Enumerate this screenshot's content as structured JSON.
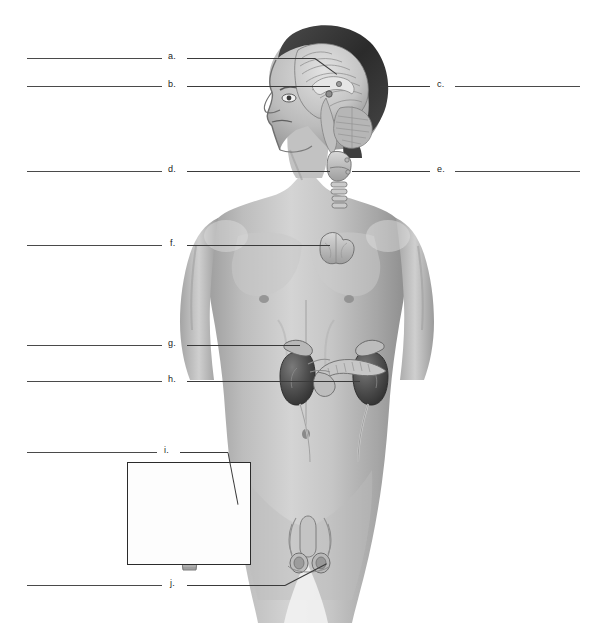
{
  "document": {
    "type": "anatomy-worksheet",
    "subject": "Human endocrine system",
    "view": "anterior male torso with mid-sagittal head section and female reproductive inset",
    "background_color": "#ffffff",
    "line_color": "#4a4a4a",
    "text_color": "#1a1a1a"
  },
  "labels": [
    {
      "id": "a",
      "text": "a.",
      "letter_x": 168,
      "letter_y": 52,
      "rule": {
        "x": 27,
        "y": 58,
        "w": 135
      },
      "leader": {
        "x1": 187,
        "y1": 58,
        "x2": 315,
        "y2": 58,
        "x3": 337,
        "y3": 74
      },
      "points_to": "pineal-gland-region"
    },
    {
      "id": "b",
      "text": "b.",
      "letter_x": 168,
      "letter_y": 80,
      "rule": {
        "x": 27,
        "y": 86,
        "w": 135
      },
      "leader": {
        "x1": 187,
        "y1": 86,
        "x2": 330,
        "y2": 86,
        "x3": 330,
        "y3": 86
      },
      "points_to": "pituitary-gland-hypothalamus"
    },
    {
      "id": "c",
      "text": "c.",
      "letter_x": 437,
      "letter_y": 80,
      "rule": {
        "x": 455,
        "y": 86,
        "w": 125
      },
      "leader": {
        "x1": 380,
        "y1": 86,
        "x2": 430,
        "y2": 86,
        "x3": 430,
        "y3": 86
      },
      "points_to": "cerebellum-brainstem-region"
    },
    {
      "id": "d",
      "text": "d.",
      "letter_x": 168,
      "letter_y": 165,
      "rule": {
        "x": 27,
        "y": 171,
        "w": 135
      },
      "leader": {
        "x1": 187,
        "y1": 171,
        "x2": 330,
        "y2": 171,
        "x3": 330,
        "y3": 171
      },
      "points_to": "thyroid-gland"
    },
    {
      "id": "e",
      "text": "e.",
      "letter_x": 437,
      "letter_y": 165,
      "rule": {
        "x": 455,
        "y": 171,
        "w": 125
      },
      "leader": {
        "x1": 352,
        "y1": 171,
        "x2": 430,
        "y2": 171,
        "x3": 430,
        "y3": 171
      },
      "points_to": "parathyroid-glands"
    },
    {
      "id": "f",
      "text": "f.",
      "letter_x": 170,
      "letter_y": 239,
      "rule": {
        "x": 27,
        "y": 245,
        "w": 135
      },
      "leader": {
        "x1": 187,
        "y1": 245,
        "x2": 330,
        "y2": 245,
        "x3": 330,
        "y3": 245
      },
      "points_to": "thymus"
    },
    {
      "id": "g",
      "text": "g.",
      "letter_x": 168,
      "letter_y": 339,
      "rule": {
        "x": 27,
        "y": 345,
        "w": 135
      },
      "leader": {
        "x1": 187,
        "y1": 345,
        "x2": 300,
        "y2": 345,
        "x3": 300,
        "y3": 345
      },
      "points_to": "adrenal-gland"
    },
    {
      "id": "h",
      "text": "h.",
      "letter_x": 168,
      "letter_y": 375,
      "rule": {
        "x": 27,
        "y": 381,
        "w": 135
      },
      "leader": {
        "x1": 187,
        "y1": 381,
        "x2": 360,
        "y2": 381,
        "x3": 360,
        "y3": 381
      },
      "points_to": "pancreas"
    },
    {
      "id": "i",
      "text": "i.",
      "letter_x": 164,
      "letter_y": 446,
      "rule": {
        "x": 27,
        "y": 452,
        "w": 130
      },
      "leader": {
        "x1": 180,
        "y1": 452,
        "x2": 228,
        "y2": 452,
        "x3": 238,
        "y3": 504
      },
      "points_to": "ovary"
    },
    {
      "id": "j",
      "text": "j.",
      "letter_x": 170,
      "letter_y": 579,
      "rule": {
        "x": 27,
        "y": 585,
        "w": 135
      },
      "leader": {
        "x1": 187,
        "y1": 585,
        "x2": 285,
        "y2": 585,
        "x3": 327,
        "y3": 563
      },
      "points_to": "testis"
    }
  ],
  "inset": {
    "name": "female-reproductive-inset",
    "x": 127,
    "y": 462,
    "w": 124,
    "h": 103,
    "border_color": "#2b2b2b",
    "contents": "uterus with fallopian tubes, ovaries and vagina"
  },
  "figure": {
    "name": "male-torso-illustration",
    "regions": [
      "head-sagittal-brain-section",
      "neck-thyroid-trachea",
      "chest-thymus",
      "abdomen-kidneys-adrenals-pancreas",
      "pelvis-testes"
    ],
    "tones": {
      "skin_light": "#d2d2d2",
      "skin_mid": "#b4b4b4",
      "skin_shadow": "#8e8e8e",
      "hair_dark": "#3a3a3a",
      "organ_dark": "#5a5a5a",
      "organ_mid": "#9a9a9a",
      "outline": "#6a6a6a"
    }
  }
}
